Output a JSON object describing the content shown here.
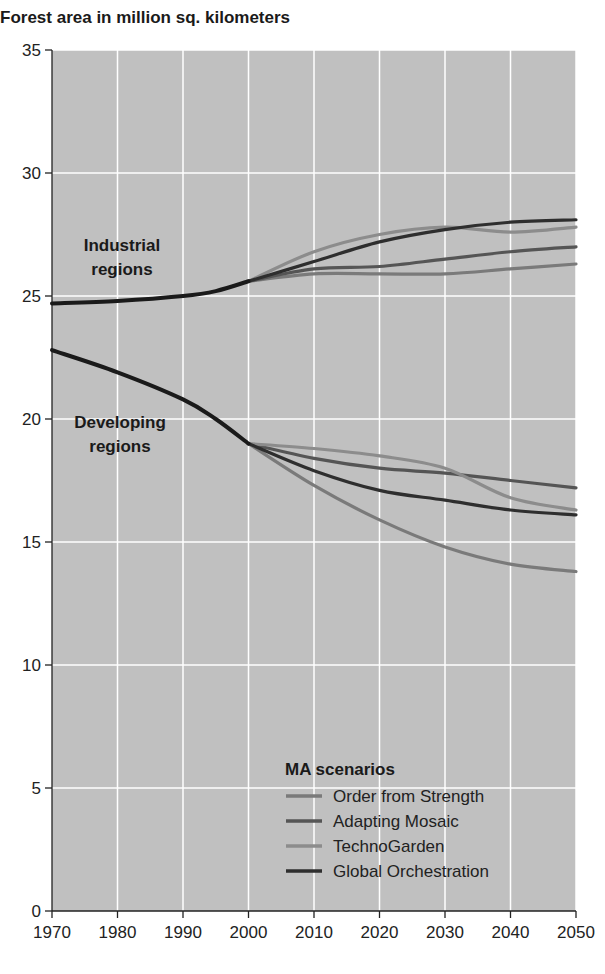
{
  "chart_data": {
    "type": "line",
    "title": "Forest area in million sq. kilometers",
    "xlabel": "",
    "ylabel": "Forest area in million sq. kilometers",
    "xlim": [
      1970,
      2050
    ],
    "ylim": [
      0,
      35
    ],
    "x_ticks": [
      1970,
      1980,
      1990,
      2000,
      2010,
      2020,
      2030,
      2040,
      2050
    ],
    "y_ticks": [
      0,
      5,
      10,
      15,
      20,
      25,
      30,
      35
    ],
    "grid": true,
    "legend_position": "bottom-right inside",
    "legend_title": "MA scenarios",
    "annotations": [
      "Industrial regions",
      "Developing regions"
    ],
    "series": [
      {
        "name": "Industrial regions (historical)",
        "group": "Industrial",
        "x": [
          1970,
          1980,
          1990,
          1995,
          2000
        ],
        "values": [
          24.7,
          24.8,
          25.0,
          25.2,
          25.6
        ]
      },
      {
        "name": "Developing regions (historical)",
        "group": "Developing",
        "x": [
          1970,
          1980,
          1990,
          1995,
          2000
        ],
        "values": [
          22.8,
          21.9,
          20.8,
          20.0,
          19.0
        ]
      },
      {
        "name": "Order from Strength",
        "group": "Industrial",
        "x": [
          2000,
          2010,
          2020,
          2030,
          2040,
          2050
        ],
        "values": [
          25.6,
          25.9,
          25.9,
          25.9,
          26.1,
          26.3
        ]
      },
      {
        "name": "Adapting Mosaic",
        "group": "Industrial",
        "x": [
          2000,
          2010,
          2020,
          2030,
          2040,
          2050
        ],
        "values": [
          25.6,
          26.1,
          26.2,
          26.5,
          26.8,
          27.0
        ]
      },
      {
        "name": "TechnoGarden",
        "group": "Industrial",
        "x": [
          2000,
          2010,
          2020,
          2030,
          2040,
          2050
        ],
        "values": [
          25.6,
          26.8,
          27.5,
          27.8,
          27.6,
          27.8
        ]
      },
      {
        "name": "Global Orchestration",
        "group": "Industrial",
        "x": [
          2000,
          2010,
          2020,
          2030,
          2040,
          2050
        ],
        "values": [
          25.6,
          26.4,
          27.2,
          27.7,
          28.0,
          28.1
        ]
      },
      {
        "name": "Order from Strength",
        "group": "Developing",
        "x": [
          2000,
          2010,
          2020,
          2030,
          2040,
          2050
        ],
        "values": [
          19.0,
          17.3,
          15.9,
          14.8,
          14.1,
          13.8
        ]
      },
      {
        "name": "Adapting Mosaic",
        "group": "Developing",
        "x": [
          2000,
          2010,
          2020,
          2030,
          2040,
          2050
        ],
        "values": [
          19.0,
          18.4,
          18.0,
          17.8,
          17.5,
          17.2
        ]
      },
      {
        "name": "TechnoGarden",
        "group": "Developing",
        "x": [
          2000,
          2010,
          2020,
          2030,
          2040,
          2050
        ],
        "values": [
          19.0,
          18.8,
          18.5,
          18.0,
          16.8,
          16.3
        ]
      },
      {
        "name": "Global Orchestration",
        "group": "Developing",
        "x": [
          2000,
          2010,
          2020,
          2030,
          2040,
          2050
        ],
        "values": [
          19.0,
          17.9,
          17.1,
          16.7,
          16.3,
          16.1
        ]
      }
    ]
  },
  "legend": {
    "title": "MA scenarios",
    "items": [
      {
        "label": "Order from Strength",
        "color": "#7a7a7a"
      },
      {
        "label": "Adapting Mosaic",
        "color": "#555555"
      },
      {
        "label": "TechnoGarden",
        "color": "#8c8c8c"
      },
      {
        "label": "Global Orchestration",
        "color": "#2e2e2e"
      }
    ]
  },
  "labels": {
    "title": "Forest area in million sq. kilometers",
    "industrial_line1": "Industrial",
    "industrial_line2": "regions",
    "developing_line1": "Developing",
    "developing_line2": "regions"
  },
  "colors": {
    "plot_background": "#c0c0c0",
    "gridline": "#ffffff",
    "historical_line": "#1a1a1a"
  }
}
